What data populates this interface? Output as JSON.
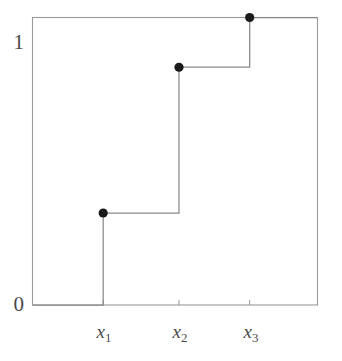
{
  "chart_data": {
    "type": "line",
    "subtype": "step-function-ecdf",
    "title": "",
    "subtitle": "",
    "xlabel": "",
    "ylabel": "",
    "grid": false,
    "legend": null,
    "line_color": "#808080",
    "marker_color": "#1a1a1a",
    "frame_color": "#9a9a9a",
    "axis_text_color": "#4a4a4a",
    "xlim": [
      0,
      1
    ],
    "ylim": [
      0,
      1
    ],
    "y_ticks": [
      {
        "value": 0,
        "label": "0"
      },
      {
        "value": 1,
        "label": "1"
      }
    ],
    "x_ticks": [
      {
        "value": 0.248,
        "label": "x₁",
        "label_base": "x",
        "label_sub": "1"
      },
      {
        "value": 0.514,
        "label": "x₂",
        "label_base": "x",
        "label_sub": "2"
      },
      {
        "value": 0.762,
        "label": "x₃",
        "label_base": "x",
        "label_sub": "3"
      }
    ],
    "jump_points": [
      {
        "x": 0.248,
        "y": 0.32,
        "x_label": "x₁",
        "filled": true
      },
      {
        "x": 0.514,
        "y": 0.827,
        "x_label": "x₂",
        "filled": true
      },
      {
        "x": 0.762,
        "y": 1.0,
        "x_label": "x₃",
        "filled": true
      }
    ],
    "step_levels": [
      {
        "from_x": 0.248,
        "to_x": 0.514,
        "y": 0.32
      },
      {
        "from_x": 0.514,
        "to_x": 0.762,
        "y": 0.827
      },
      {
        "from_x": 0.762,
        "to_x": 1.0,
        "y": 1.0
      }
    ],
    "baseline": {
      "from_x": 0.0,
      "to_x": 0.248,
      "y": 0.0
    }
  },
  "labels": {
    "y_top": "1",
    "y_bottom": "0",
    "x1_base": "x",
    "x1_sub": "1",
    "x2_base": "x",
    "x2_sub": "2",
    "x3_base": "x",
    "x3_sub": "3"
  }
}
